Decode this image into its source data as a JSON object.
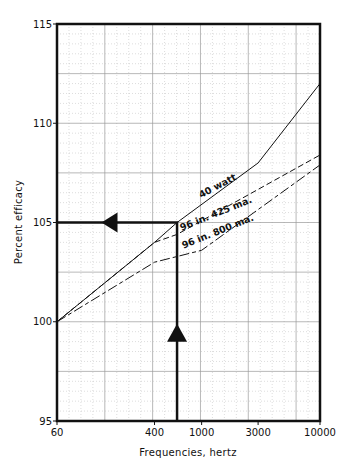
{
  "chart_data": {
    "type": "line",
    "title": "",
    "xlabel": "Frequencies, hertz",
    "ylabel": "Percent efficacy",
    "xscale": "log",
    "xlim": [
      60,
      10000
    ],
    "ylim": [
      95,
      115
    ],
    "xticks": [
      60,
      400,
      1000,
      3000,
      10000
    ],
    "xtick_labels": [
      "60",
      "400",
      "1000",
      "3000",
      "10000"
    ],
    "yticks": [
      95,
      100,
      105,
      110,
      115
    ],
    "ytick_labels": [
      "95",
      "100",
      "105",
      "110",
      "115"
    ],
    "grid": true,
    "legend": "inline-labels",
    "series": [
      {
        "name": "40 watt",
        "style": "solid",
        "x": [
          60,
          400,
          620,
          3000,
          10000
        ],
        "y": [
          100,
          104.0,
          105.0,
          108.0,
          112.0
        ]
      },
      {
        "name": "96 in. 425 ma.",
        "style": "dashed",
        "x": [
          60,
          400,
          620,
          10000
        ],
        "y": [
          100,
          104.0,
          104.4,
          108.4
        ]
      },
      {
        "name": "96 in. 800 ma.",
        "style": "dashdot",
        "x": [
          60,
          400,
          1000,
          10000
        ],
        "y": [
          100,
          103.0,
          103.6,
          107.9
        ]
      }
    ],
    "annotations": [
      {
        "type": "arrow-path",
        "description": "Vertical line at ~620 Hz from 95 up to 105 (upward arrow), then horizontal line left to 60 Hz at 105 (leftward arrow)",
        "x": 620,
        "y": 105
      }
    ]
  }
}
